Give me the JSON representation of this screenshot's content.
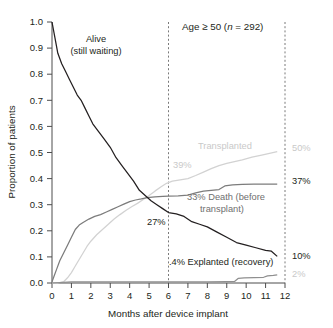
{
  "chart_data": {
    "type": "line",
    "title": "Age ≥ 50 (n = 292)",
    "xlabel": "Months after device implant",
    "ylabel": "Proportion of patients",
    "xlim": [
      0,
      12
    ],
    "ylim": [
      0,
      1
    ],
    "grid": false,
    "legend_position": "inline-annotations",
    "xticks": [
      "0",
      "1",
      "2",
      "3",
      "4",
      "5",
      "6",
      "7",
      "8",
      "9",
      "10",
      "11",
      "12"
    ],
    "yticks": [
      "0.0",
      "0.1",
      "0.2",
      "0.3",
      "0.4",
      "0.5",
      "0.6",
      "0.7",
      "0.8",
      "0.9",
      "1.0"
    ],
    "reference_lines": [
      {
        "name": "month-6",
        "x": 6,
        "style": "dashed"
      },
      {
        "name": "month-12",
        "x": 12,
        "style": "dashed"
      }
    ],
    "series": [
      {
        "name": "Alive (still waiting)",
        "color": "#231f20",
        "x": [
          0,
          0.15,
          0.3,
          0.5,
          0.7,
          0.9,
          1.1,
          1.3,
          1.5,
          1.7,
          1.9,
          2.1,
          2.4,
          2.7,
          3.0,
          3.3,
          3.6,
          3.9,
          4.2,
          4.5,
          4.8,
          5.1,
          5.4,
          5.7,
          6.0,
          6.4,
          6.8,
          7.2,
          7.6,
          8.0,
          8.5,
          9.0,
          9.5,
          10.0,
          10.5,
          11.0,
          11.3,
          11.6
        ],
        "y": [
          1.0,
          0.94,
          0.88,
          0.84,
          0.81,
          0.78,
          0.75,
          0.72,
          0.7,
          0.67,
          0.64,
          0.61,
          0.58,
          0.55,
          0.52,
          0.48,
          0.45,
          0.42,
          0.39,
          0.355,
          0.335,
          0.315,
          0.3,
          0.285,
          0.27,
          0.265,
          0.255,
          0.235,
          0.225,
          0.215,
          0.195,
          0.175,
          0.155,
          0.145,
          0.135,
          0.125,
          0.122,
          0.102
        ]
      },
      {
        "name": "Death (before transplant)",
        "color": "#7c7c7c",
        "x": [
          0,
          0.1,
          0.25,
          0.4,
          0.6,
          0.8,
          1.0,
          1.2,
          1.4,
          1.6,
          1.9,
          2.2,
          2.5,
          2.8,
          3.1,
          3.4,
          3.7,
          4.0,
          4.3,
          4.6,
          4.9,
          5.3,
          5.7,
          6.0,
          6.5,
          7.0,
          7.4,
          7.8,
          8.2,
          8.6,
          8.9,
          9.3,
          9.8,
          10.4,
          11.0,
          11.6
        ],
        "y": [
          0.005,
          0.025,
          0.055,
          0.085,
          0.115,
          0.145,
          0.175,
          0.205,
          0.222,
          0.232,
          0.245,
          0.255,
          0.262,
          0.272,
          0.282,
          0.292,
          0.302,
          0.312,
          0.318,
          0.322,
          0.327,
          0.33,
          0.332,
          0.333,
          0.334,
          0.337,
          0.345,
          0.352,
          0.355,
          0.358,
          0.372,
          0.376,
          0.378,
          0.379,
          0.379,
          0.379
        ]
      },
      {
        "name": "Transplanted",
        "color": "#d2d2d2",
        "x": [
          0,
          0.3,
          0.6,
          0.8,
          1.0,
          1.2,
          1.4,
          1.6,
          1.8,
          2.0,
          2.3,
          2.6,
          2.9,
          3.2,
          3.5,
          3.8,
          4.1,
          4.4,
          4.7,
          5.0,
          5.3,
          5.6,
          5.9,
          6.2,
          6.6,
          7.0,
          7.4,
          7.8,
          8.2,
          8.6,
          9.0,
          9.4,
          9.8,
          10.3,
          10.8,
          11.2,
          11.6
        ],
        "y": [
          0.0,
          0.0,
          0.005,
          0.02,
          0.04,
          0.065,
          0.09,
          0.115,
          0.14,
          0.16,
          0.185,
          0.205,
          0.225,
          0.245,
          0.262,
          0.278,
          0.292,
          0.305,
          0.32,
          0.335,
          0.352,
          0.368,
          0.382,
          0.39,
          0.395,
          0.4,
          0.412,
          0.425,
          0.438,
          0.45,
          0.458,
          0.465,
          0.472,
          0.482,
          0.49,
          0.497,
          0.503
        ]
      },
      {
        "name": "Explanted (recovery)",
        "color": "#8f8f8f",
        "x": [
          0,
          1.0,
          2.0,
          3.0,
          4.0,
          5.0,
          6.0,
          7.0,
          8.0,
          9.0,
          9.4,
          9.6,
          9.9,
          10.4,
          10.9,
          11.1,
          11.4,
          11.6
        ],
        "y": [
          0.0,
          0.004,
          0.004,
          0.004,
          0.004,
          0.004,
          0.004,
          0.004,
          0.004,
          0.005,
          0.006,
          0.018,
          0.02,
          0.021,
          0.022,
          0.027,
          0.029,
          0.031
        ]
      }
    ],
    "annotations": [
      {
        "name": "alive-label",
        "text_lines": [
          "Alive",
          "(still waiting)"
        ],
        "color": "#231f20"
      },
      {
        "name": "transplanted-label",
        "text": "Transplanted",
        "color": "#c9c9c9"
      },
      {
        "name": "death-label",
        "text_lines": [
          "33% Death (before",
          "transplant)"
        ],
        "color": "#6f6f6f"
      },
      {
        "name": "explanted-label",
        "text": ".4% Explanted (recovery)",
        "color": "#231f20"
      },
      {
        "name": "alive-at-6mo",
        "text": "27%",
        "color": "#231f20"
      },
      {
        "name": "transplanted-at-6mo",
        "text": "39%",
        "color": "#c9c9c9"
      }
    ],
    "endpoint_labels": [
      {
        "name": "transplanted-endpoint",
        "text": "50%",
        "color": "#c9c9c9",
        "value": 0.5
      },
      {
        "name": "death-endpoint",
        "text": "37%",
        "color": "#231f20",
        "value": 0.37
      },
      {
        "name": "alive-endpoint",
        "text": "10%",
        "color": "#231f20",
        "value": 0.1
      },
      {
        "name": "explanted-endpoint",
        "text": "2%",
        "color": "#c9c9c9",
        "value": 0.02
      }
    ]
  },
  "labels": {
    "title": "Age ≥ 50 (",
    "title_n": "n",
    "title_tail": " = 292)",
    "xlabel": "Months after device implant",
    "ylabel": "Proportion of patients",
    "alive_line1": "Alive",
    "alive_line2": "(still waiting)",
    "transplanted": "Transplanted",
    "death_line1": "33% Death (before",
    "death_line2": "transplant)",
    "explanted": ".4% Explanted (recovery)",
    "pct_27": "27%",
    "pct_39": "39%",
    "pct_50": "50%",
    "pct_37": "37%",
    "pct_10": "10%",
    "pct_2": "2%"
  }
}
